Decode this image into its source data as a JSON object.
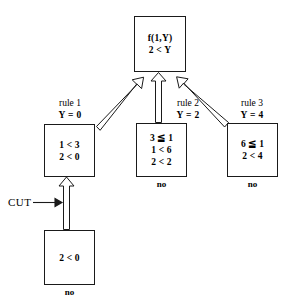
{
  "diagram": {
    "type": "proof-search-tree",
    "root": {
      "lines": [
        "f(1,Y)",
        "2 < Y"
      ]
    },
    "branches": [
      {
        "rule_name": "rule 1",
        "binding": "Y = 0",
        "lines": [
          "1 < 3",
          "2 < 0"
        ],
        "answer": ""
      },
      {
        "rule_name": "rule 2",
        "binding": "Y = 2",
        "lines": [
          "3 ≦ 1",
          "1 < 6",
          "2 < 2"
        ],
        "answer": "no"
      },
      {
        "rule_name": "rule 3",
        "binding": "Y = 4",
        "lines": [
          "6 ≦ 1",
          "2 < 4"
        ],
        "answer": "no"
      }
    ],
    "cut": {
      "label": "CUT",
      "lines": [
        "2 < 0"
      ],
      "answer": "no"
    },
    "colors": {
      "stroke": "#1a1a1a",
      "fill": "#ffffff",
      "text": "#000000"
    }
  }
}
